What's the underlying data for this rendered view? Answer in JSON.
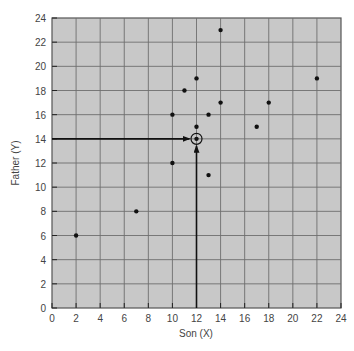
{
  "chart_data": {
    "type": "scatter",
    "title": "",
    "xlabel": "Son (X)",
    "ylabel": "Father (Y)",
    "xlim": [
      0,
      24
    ],
    "ylim": [
      0,
      24
    ],
    "xticks": [
      0,
      2,
      4,
      6,
      8,
      10,
      12,
      14,
      16,
      18,
      20,
      22,
      24
    ],
    "yticks": [
      0,
      2,
      4,
      6,
      8,
      10,
      12,
      14,
      16,
      18,
      20,
      22,
      24
    ],
    "grid": true,
    "legend": null,
    "points": [
      {
        "x": 2,
        "y": 6
      },
      {
        "x": 7,
        "y": 8
      },
      {
        "x": 10,
        "y": 12
      },
      {
        "x": 10,
        "y": 16
      },
      {
        "x": 11,
        "y": 18
      },
      {
        "x": 12,
        "y": 19
      },
      {
        "x": 12,
        "y": 15
      },
      {
        "x": 12,
        "y": 14
      },
      {
        "x": 13,
        "y": 16
      },
      {
        "x": 13,
        "y": 11
      },
      {
        "x": 14,
        "y": 23
      },
      {
        "x": 14,
        "y": 17
      },
      {
        "x": 17,
        "y": 15
      },
      {
        "x": 18,
        "y": 17
      },
      {
        "x": 22,
        "y": 19
      }
    ],
    "annotations": [
      {
        "type": "circled-point",
        "x": 12,
        "y": 14,
        "note": "mean point (X̄, Ȳ)"
      },
      {
        "type": "arrow",
        "from": [
          0,
          14
        ],
        "to": [
          12,
          14
        ],
        "direction": "horizontal"
      },
      {
        "type": "arrow",
        "from": [
          12,
          0
        ],
        "to": [
          12,
          14
        ],
        "direction": "vertical"
      }
    ]
  },
  "colors": {
    "plot_background": "#c8c8c8",
    "grid": "#6e6e6e",
    "points": "#111111",
    "arrows": "#111111"
  }
}
